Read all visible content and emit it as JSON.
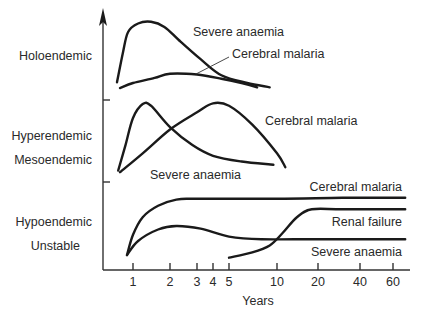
{
  "chart_data": {
    "type": "line",
    "title": "",
    "xlabel": "Years",
    "ylabel": "",
    "x_scale": "log-like",
    "x_ticks": [
      1,
      2,
      3,
      4,
      5,
      10,
      20,
      40,
      60
    ],
    "x_tick_labels": [
      "1",
      "2",
      "3",
      "4",
      "5",
      "10",
      "20",
      "40",
      "60"
    ],
    "xlim": [
      0.6,
      70
    ],
    "grid": false,
    "legend": "none (curves labeled directly)",
    "y_units": "relative frequency within each endemicity band (0 = band bottom, 1 = band top)",
    "bands": [
      {
        "name": "holoendemic",
        "labels": [
          "Holoendemic"
        ],
        "series": [
          {
            "name": "Severe anaemia",
            "label": "Severe anaemia",
            "points": [
              [
                0.7,
                0.21
              ],
              [
                0.8,
                0.55
              ],
              [
                0.9,
                0.8
              ],
              [
                1.1,
                0.9
              ],
              [
                1.4,
                0.92
              ],
              [
                1.8,
                0.86
              ],
              [
                2.3,
                0.7
              ],
              [
                3.2,
                0.48
              ],
              [
                4.5,
                0.29
              ],
              [
                6.5,
                0.2
              ],
              [
                9.0,
                0.15
              ]
            ]
          },
          {
            "name": "Cerebral malaria",
            "label": "Cerebral malaria",
            "points": [
              [
                0.75,
                0.14
              ],
              [
                1.0,
                0.2
              ],
              [
                1.5,
                0.26
              ],
              [
                2.0,
                0.31
              ],
              [
                3.0,
                0.3
              ],
              [
                4.5,
                0.25
              ],
              [
                6.0,
                0.2
              ],
              [
                7.5,
                0.15
              ]
            ]
          }
        ]
      },
      {
        "name": "hyperendemic-mesoendemic",
        "labels": [
          "Hyperendemic",
          "Mesoendemic"
        ],
        "series": [
          {
            "name": "Severe anaemia",
            "label": "Severe anaemia",
            "points": [
              [
                0.72,
                0.14
              ],
              [
                0.85,
                0.45
              ],
              [
                1.0,
                0.78
              ],
              [
                1.2,
                0.95
              ],
              [
                1.4,
                0.93
              ],
              [
                2.0,
                0.67
              ],
              [
                2.8,
                0.45
              ],
              [
                4.0,
                0.32
              ],
              [
                6.0,
                0.25
              ],
              [
                9.5,
                0.21
              ]
            ]
          },
          {
            "name": "Cerebral malaria",
            "label": "Cerebral malaria",
            "points": [
              [
                0.75,
                0.12
              ],
              [
                1.2,
                0.35
              ],
              [
                2.0,
                0.64
              ],
              [
                3.0,
                0.85
              ],
              [
                4.0,
                0.96
              ],
              [
                5.0,
                0.93
              ],
              [
                7.0,
                0.7
              ],
              [
                10.0,
                0.35
              ],
              [
                11.5,
                0.18
              ]
            ]
          }
        ]
      },
      {
        "name": "hypoendemic-unstable",
        "labels": [
          "Hypoendemic",
          "Unstable"
        ],
        "series": [
          {
            "name": "Cerebral malaria",
            "label": "Cerebral malaria",
            "points": [
              [
                0.88,
                0.17
              ],
              [
                1.0,
                0.4
              ],
              [
                1.2,
                0.6
              ],
              [
                1.6,
                0.73
              ],
              [
                2.2,
                0.8
              ],
              [
                3.0,
                0.81
              ],
              [
                10.0,
                0.81
              ],
              [
                30.0,
                0.82
              ],
              [
                68.0,
                0.82
              ]
            ]
          },
          {
            "name": "Severe anaemia",
            "label": "Severe anaemia",
            "points": [
              [
                0.88,
                0.17
              ],
              [
                1.1,
                0.33
              ],
              [
                1.6,
                0.46
              ],
              [
                2.2,
                0.5
              ],
              [
                3.2,
                0.47
              ],
              [
                5.0,
                0.38
              ],
              [
                8.0,
                0.35
              ],
              [
                20.0,
                0.35
              ],
              [
                68.0,
                0.35
              ]
            ]
          },
          {
            "name": "Renal failure",
            "label": "Renal failure",
            "points": [
              [
                5.0,
                0.14
              ],
              [
                7.0,
                0.2
              ],
              [
                9.0,
                0.28
              ],
              [
                11.0,
                0.42
              ],
              [
                14.0,
                0.6
              ],
              [
                18.0,
                0.69
              ],
              [
                30.0,
                0.69
              ],
              [
                68.0,
                0.69
              ]
            ]
          }
        ]
      }
    ]
  }
}
